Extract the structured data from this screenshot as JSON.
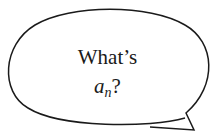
{
  "bubble": {
    "line1": "What’s",
    "variable": "a",
    "subscript": "n",
    "suffix": "?",
    "stroke_color": "#1a1a1a",
    "fill_color": "#ffffff"
  }
}
